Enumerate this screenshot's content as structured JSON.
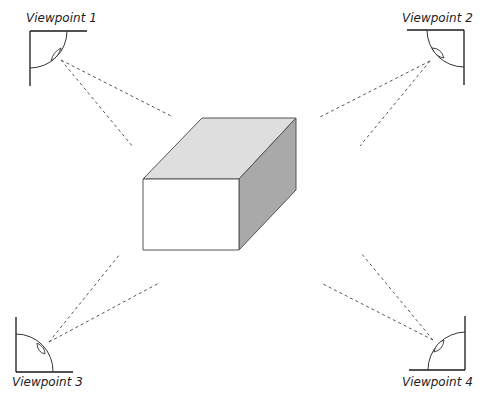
{
  "diagram": {
    "colors": {
      "top_face": "#dedede",
      "front_face": "#ffffff",
      "side_face": "#a9a9a9",
      "line": "#555555"
    },
    "cube": {
      "front_top_left": [
        143,
        179
      ],
      "front_top_right": [
        239,
        179
      ],
      "front_bottom_left": [
        143,
        250
      ],
      "front_bottom_right": [
        239,
        250
      ],
      "back_top_left": [
        202,
        118
      ],
      "back_top_right": [
        296,
        118
      ],
      "back_bottom_right": [
        296,
        190
      ]
    },
    "viewpoints": [
      {
        "id": 1,
        "label": "Viewpoint 1",
        "position": "top-left",
        "icon": "camera-corner-icon"
      },
      {
        "id": 2,
        "label": "Viewpoint 2",
        "position": "top-right",
        "icon": "camera-corner-icon"
      },
      {
        "id": 3,
        "label": "Viewpoint 3",
        "position": "bottom-left",
        "icon": "camera-corner-icon"
      },
      {
        "id": 4,
        "label": "Viewpoint 4",
        "position": "bottom-right",
        "icon": "camera-corner-icon"
      }
    ]
  }
}
